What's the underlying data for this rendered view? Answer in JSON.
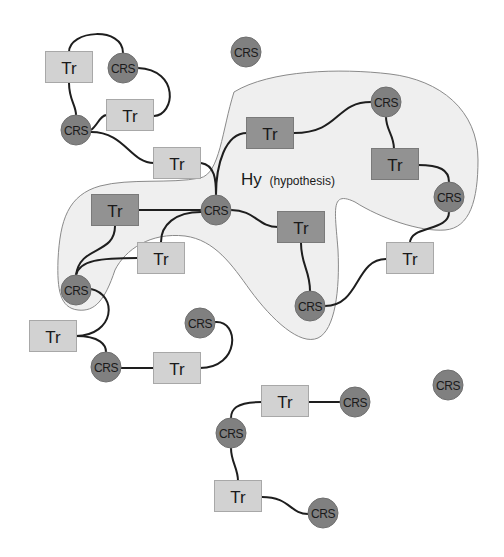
{
  "diagram": {
    "colors": {
      "background": "#ffffff",
      "region_fill": "#efefef",
      "region_stroke": "#8a8a8a",
      "tr_light_fill": "#d2d2d2",
      "tr_light_stroke": "#a8a8a8",
      "tr_dark_fill": "#929292",
      "tr_dark_stroke": "#7a7a7a",
      "crs_fill": "#808080",
      "crs_stroke": "#6e6e6e",
      "edge": "#1e1e1e"
    },
    "region": {
      "label_main": "Hy",
      "label_sub": "(hypothesis)"
    },
    "labels": {
      "tr": "Tr",
      "crs": "CRS"
    },
    "nodes": [
      {
        "id": "tr1",
        "type": "Tr",
        "shade": "light",
        "x": 69,
        "y": 67
      },
      {
        "id": "crs1",
        "type": "CRS",
        "x": 123,
        "y": 68
      },
      {
        "id": "tr2",
        "type": "Tr",
        "shade": "light",
        "x": 130,
        "y": 115
      },
      {
        "id": "crs2",
        "type": "CRS",
        "x": 76,
        "y": 130
      },
      {
        "id": "tr3",
        "type": "Tr",
        "shade": "light",
        "x": 177,
        "y": 163
      },
      {
        "id": "crs3",
        "type": "CRS",
        "x": 246,
        "y": 52
      },
      {
        "id": "tr4",
        "type": "Tr",
        "shade": "dark",
        "x": 270,
        "y": 133
      },
      {
        "id": "crs4",
        "type": "CRS",
        "x": 386,
        "y": 102
      },
      {
        "id": "tr5",
        "type": "Tr",
        "shade": "dark",
        "x": 395,
        "y": 164
      },
      {
        "id": "crs5",
        "type": "CRS",
        "x": 449,
        "y": 197
      },
      {
        "id": "crs6",
        "type": "CRS",
        "x": 216,
        "y": 210
      },
      {
        "id": "tr6",
        "type": "Tr",
        "shade": "dark",
        "x": 115,
        "y": 210
      },
      {
        "id": "tr7",
        "type": "Tr",
        "shade": "dark",
        "x": 301,
        "y": 227
      },
      {
        "id": "tr8",
        "type": "Tr",
        "shade": "light",
        "x": 161,
        "y": 258
      },
      {
        "id": "tr9",
        "type": "Tr",
        "shade": "light",
        "x": 410,
        "y": 258
      },
      {
        "id": "crs7",
        "type": "CRS",
        "x": 76,
        "y": 290
      },
      {
        "id": "crs8",
        "type": "CRS",
        "x": 310,
        "y": 306
      },
      {
        "id": "crs9",
        "type": "CRS",
        "x": 200,
        "y": 323
      },
      {
        "id": "tr10",
        "type": "Tr",
        "shade": "light",
        "x": 53,
        "y": 336
      },
      {
        "id": "crs10",
        "type": "CRS",
        "x": 106,
        "y": 367
      },
      {
        "id": "tr11",
        "type": "Tr",
        "shade": "light",
        "x": 177,
        "y": 368
      },
      {
        "id": "crs11",
        "type": "CRS",
        "x": 448,
        "y": 385
      },
      {
        "id": "tr12",
        "type": "Tr",
        "shade": "light",
        "x": 285,
        "y": 401
      },
      {
        "id": "crs12",
        "type": "CRS",
        "x": 355,
        "y": 402
      },
      {
        "id": "crs13",
        "type": "CRS",
        "x": 231,
        "y": 433
      },
      {
        "id": "tr13",
        "type": "Tr",
        "shade": "light",
        "x": 238,
        "y": 496
      },
      {
        "id": "crs14",
        "type": "CRS",
        "x": 323,
        "y": 513
      }
    ]
  }
}
